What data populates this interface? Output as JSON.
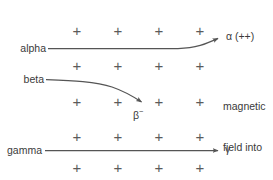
{
  "diagram": {
    "background_color": "#ffffff",
    "line_color": "#555555",
    "plus_color": "#5b5b5b",
    "text_color": "#3a3a3a",
    "field": {
      "note_line1": "magnetic",
      "note_line2": "field into",
      "note_line3": "page",
      "symbol": "+",
      "rows": 5,
      "columns": 4,
      "row_y": [
        30,
        65,
        101,
        136,
        167
      ],
      "column_x": [
        77,
        118,
        159,
        200
      ]
    },
    "tracks": [
      {
        "id": "alpha",
        "label": "alpha",
        "symbol": "α (++)",
        "charge": "++",
        "deflection": "upward",
        "label_x": 13,
        "label_y": 42
      },
      {
        "id": "beta",
        "label": "beta",
        "symbol_base": "β",
        "symbol_sup": "−",
        "charge": "−",
        "deflection": "downward",
        "label_x": 20,
        "label_y": 74
      },
      {
        "id": "gamma",
        "label": "gamma",
        "symbol": "γ",
        "charge": "0",
        "deflection": "none",
        "label_x": 8,
        "label_y": 145
      }
    ]
  }
}
